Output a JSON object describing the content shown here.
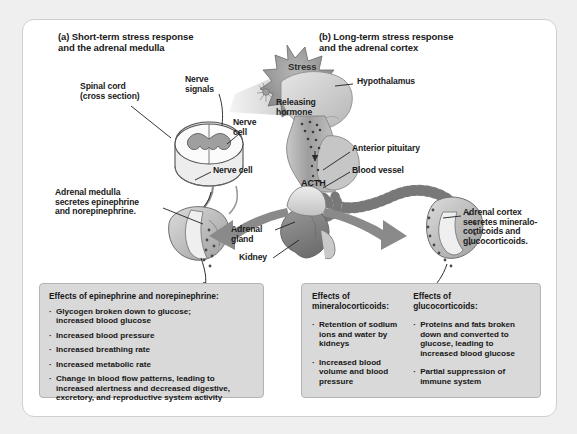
{
  "figure": {
    "panel_a": {
      "title": "(a) Short-term stress response\nand the adrenal medulla",
      "labels": {
        "spinal_cord": "Spinal cord\n(cross section)",
        "nerve_signals": "Nerve\nsignals",
        "nerve_cell_upper": "Nerve\ncell",
        "nerve_cell_lower": "Nerve cell",
        "adrenal_medulla": "Adrenal medulla\nsecretes epinephrine\nand norepinephrine."
      }
    },
    "panel_b": {
      "title": "(b) Long-term stress response\nand the adrenal cortex",
      "labels": {
        "hypothalamus": "Hypothalamus",
        "releasing_hormone": "Releasing\nhormone",
        "anterior_pituitary": "Anterior pituitary",
        "blood_vessel": "Blood vessel",
        "acth": "ACTH",
        "adrenal_cortex": "Adrenal cortex\nsecretes mineralo-\ncorticoids and\nglucocorticoids."
      }
    },
    "center": {
      "stress": "Stress",
      "adrenal_gland": "Adrenal\ngland",
      "kidney": "Kidney"
    },
    "effects_boxes": [
      {
        "id": "epinephrine",
        "heading": "Effects of epinephrine and norepinephrine:",
        "bullets": [
          "Glycogen broken down to glucose;\nincreased blood  glucose",
          "Increased blood pressure",
          "Increased breathing rate",
          "Increased metabolic rate",
          "Change in blood flow patterns, leading to\nincreased alertness and decreased digestive,\nexcretory, and reproductive system activity"
        ]
      },
      {
        "id": "mineralocorticoids",
        "heading": "Effects of\nmineralocorticoids:",
        "bullets": [
          "Retention of sodium\nions and water by\nkidneys",
          "Increased blood\nvolume and blood\npressure"
        ]
      },
      {
        "id": "glucocorticoids",
        "heading": "Effects of\nglucocorticoids:",
        "bullets": [
          "Proteins and fats broken\ndown and converted to\nglucose, leading to\nincreased blood glucose",
          "Partial suppression of\nimmune system"
        ]
      }
    ],
    "colors": {
      "page_background": "#efefef",
      "figure_background": "#ffffff",
      "panel_fill": "#d9d9d9",
      "text": "#1a1a1a",
      "arrow_gray": "#8a8a8a",
      "stress_burst": "#8f8f8f",
      "organ_light": "#d5d5d5",
      "organ_mid": "#a8a8a8",
      "organ_dark": "#7b7b7b",
      "outline": "#555555"
    }
  }
}
